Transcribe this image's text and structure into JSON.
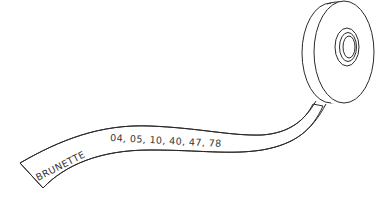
{
  "illustration": {
    "subject": "tape-spool-with-printed-ribbon",
    "tape": {
      "label": "BRUNETTE",
      "numbers": "04,  05,  10,  40,  47,  78",
      "number_values": [
        "04",
        "05",
        "10",
        "40",
        "47",
        "78"
      ]
    },
    "colors": {
      "background": "#ffffff",
      "stroke": "#2a2a2a",
      "text": "#333333"
    }
  }
}
